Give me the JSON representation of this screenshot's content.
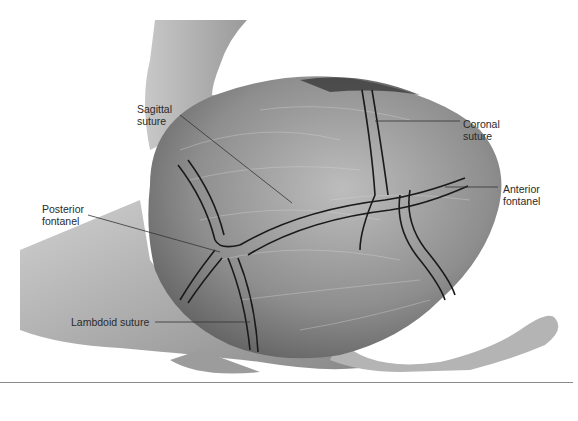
{
  "figure": {
    "colors": {
      "background": "#ffffff",
      "suture_line": "#1a1a1a",
      "leader_line": "#333333",
      "text": "#2a2a2a",
      "rule": "#8a8a8a"
    }
  },
  "labels": {
    "sagittal": {
      "line1": "Sagittal",
      "line2": "suture"
    },
    "coronal": {
      "line1": "Coronal",
      "line2": "suture"
    },
    "anterior": {
      "line1": "Anterior",
      "line2": "fontanel"
    },
    "posterior": {
      "line1": "Posterior",
      "line2": "fontanel"
    },
    "lambdoid": {
      "line1": "Lambdoid suture"
    }
  }
}
